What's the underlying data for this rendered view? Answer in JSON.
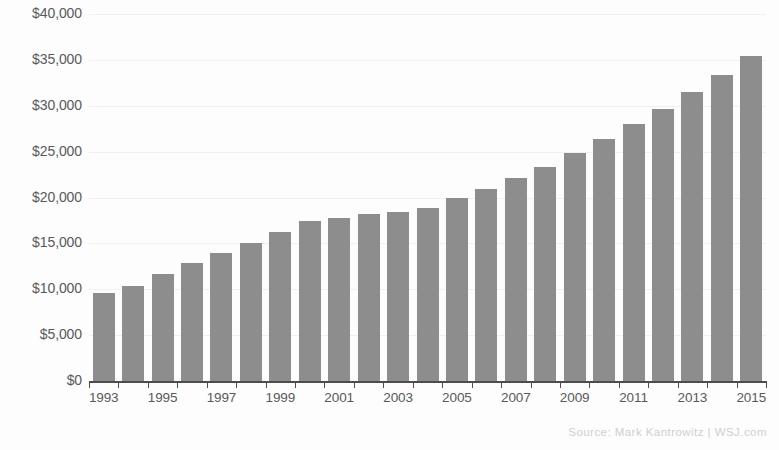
{
  "chart_data": {
    "type": "bar",
    "title": "",
    "xlabel": "",
    "ylabel": "",
    "ylim": [
      0,
      40000
    ],
    "ytick_values": [
      0,
      5000,
      10000,
      15000,
      20000,
      25000,
      30000,
      35000,
      40000
    ],
    "ytick_labels": [
      "$0",
      "$5,000",
      "$10,000",
      "$15,000",
      "$20,000",
      "$25,000",
      "$30,000",
      "$35,000",
      "$40,000"
    ],
    "grid": true,
    "legend": null,
    "categories": [
      "1993",
      "1994",
      "1995",
      "1996",
      "1997",
      "1998",
      "1999",
      "2000",
      "2001",
      "2002",
      "2003",
      "2004",
      "2005",
      "2006",
      "2007",
      "2008",
      "2009",
      "2010",
      "2011",
      "2012",
      "2013",
      "2014",
      "2015"
    ],
    "xtick_labels_shown": [
      "1993",
      "1995",
      "1997",
      "1999",
      "2001",
      "2003",
      "2005",
      "2007",
      "2009",
      "2011",
      "2013",
      "2015"
    ],
    "values": [
      9600,
      10400,
      11700,
      12900,
      14000,
      15000,
      16200,
      17400,
      17800,
      18200,
      18400,
      18900,
      20000,
      20900,
      22100,
      23300,
      24900,
      26400,
      28000,
      29700,
      31500,
      33300,
      35400
    ],
    "bar_color": "#8d8d8d"
  },
  "annotations": {
    "source": "Source: Mark Kantrowitz  |  WSJ.com"
  }
}
